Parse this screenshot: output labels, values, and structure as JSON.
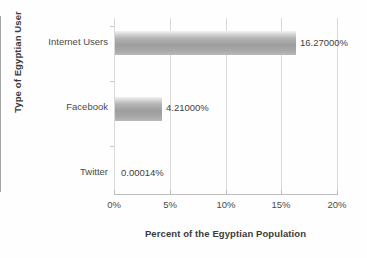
{
  "chart_data": {
    "type": "bar",
    "orientation": "horizontal",
    "title": "",
    "xlabel": "Percent of the Egyptian Population",
    "ylabel": "Type of Egyptian User",
    "categories": [
      "Internet Users",
      "Facebook",
      "Twitter"
    ],
    "values": [
      16.27,
      4.21,
      0.00014
    ],
    "value_labels": [
      "16.27000%",
      "4.21000%",
      "0.00014%"
    ],
    "xlim": [
      0,
      20
    ],
    "xticks": [
      0,
      5,
      10,
      15,
      20
    ],
    "xtick_labels": [
      "0%",
      "5%",
      "10%",
      "15%",
      "20%"
    ],
    "grid": "vertical",
    "legend": "none",
    "series": [
      {
        "name": "Percent of the Egyptian Population",
        "values": [
          16.27,
          4.21,
          0.00014
        ]
      }
    ],
    "colors": {
      "bar_light": "#f2f2f2",
      "bar_mid": "#b4b4b4",
      "bar_dark": "#9d9d9d",
      "gridline": "#d9d9d9",
      "axis": "#a6a6a6",
      "text": "#3b3b3b",
      "background": "#ffffff"
    }
  }
}
